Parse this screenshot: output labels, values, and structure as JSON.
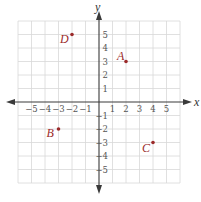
{
  "chart_data": {
    "type": "scatter",
    "title": "",
    "xlabel": "x",
    "ylabel": "y",
    "xlim": [
      -6,
      6
    ],
    "ylim": [
      -6,
      6
    ],
    "grid": true,
    "xticks": [
      -5,
      -4,
      -3,
      -2,
      -1,
      1,
      2,
      3,
      4,
      5
    ],
    "yticks": [
      -5,
      -4,
      -3,
      -2,
      -1,
      1,
      2,
      3,
      4,
      5
    ],
    "xtick_labels": [
      "−5",
      "−4",
      "−3",
      "−2",
      "−1",
      "1",
      "2",
      "3",
      "4",
      "5"
    ],
    "ytick_labels": [
      "−5",
      "−4",
      "−3",
      "−2",
      "−1",
      "1",
      "2",
      "3",
      "4",
      "5"
    ],
    "points": [
      {
        "label": "A",
        "x": 2,
        "y": 3
      },
      {
        "label": "B",
        "x": -3,
        "y": -2
      },
      {
        "label": "C",
        "x": 4,
        "y": -3
      },
      {
        "label": "D",
        "x": -2,
        "y": 5
      }
    ],
    "colors": {
      "point": "#9b2a2a",
      "grid": "#d8d8d8",
      "axis": "#3a3a3a"
    }
  },
  "axes": {
    "x_label": "x",
    "y_label": "y"
  }
}
